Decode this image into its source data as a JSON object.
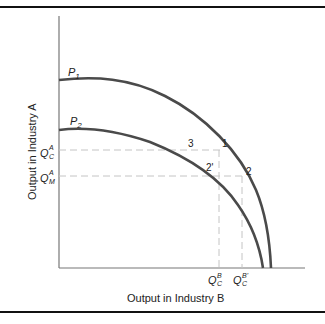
{
  "diagram": {
    "type": "production-possibility-frontier",
    "x_axis_label": "Output in Industry B",
    "y_axis_label": "Output in Industry A",
    "curves": [
      {
        "name": "P",
        "sub": "1"
      },
      {
        "name": "P",
        "sub": "2"
      }
    ],
    "y_ticks": [
      {
        "base": "Q",
        "sup": "A",
        "sub": "C"
      },
      {
        "base": "Q",
        "sup": "A",
        "sub": "M"
      }
    ],
    "x_ticks": [
      {
        "base": "Q",
        "sup": "B",
        "sub": "C"
      },
      {
        "base": "Q",
        "sup": "B'",
        "sub": "C"
      }
    ],
    "points": [
      {
        "label": "1"
      },
      {
        "label": "2"
      },
      {
        "label": "3"
      },
      {
        "label": "2'"
      }
    ],
    "colors": {
      "curve": "#4a4a4a",
      "axis": "#777777",
      "dashed": "#bdbdbd",
      "rule": "#111111"
    }
  }
}
